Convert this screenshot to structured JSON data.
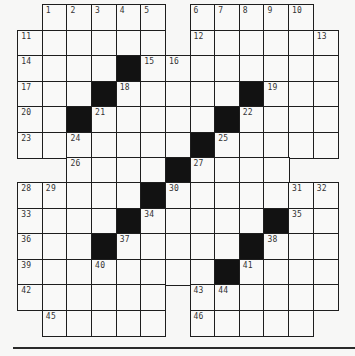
{
  "puzzle": {
    "type": "crossword",
    "rows": 13,
    "cols": 13,
    "layout": {
      "left": 18,
      "top": 5,
      "cell_width": 24.62,
      "cell_height": 25.46
    },
    "legend": {
      ".": "no cell",
      "#": "black square",
      "0": "white unnumbered",
      "n": "white numbered"
    },
    "colors": {
      "background": "#f7f7f6",
      "cell": "#f9f9f8",
      "black": "#121212",
      "line": "#1e1e1e"
    },
    "grid": [
      [
        ".",
        1,
        2,
        3,
        4,
        5,
        ".",
        6,
        7,
        8,
        9,
        10,
        "."
      ],
      [
        11,
        0,
        0,
        0,
        0,
        0,
        ".",
        12,
        0,
        0,
        0,
        0,
        13
      ],
      [
        14,
        0,
        0,
        0,
        "#",
        15,
        16,
        0,
        0,
        0,
        0,
        0,
        0
      ],
      [
        17,
        0,
        0,
        "#",
        18,
        0,
        0,
        0,
        0,
        "#",
        19,
        0,
        0
      ],
      [
        20,
        0,
        "#",
        21,
        0,
        0,
        0,
        0,
        "#",
        22,
        0,
        0,
        0
      ],
      [
        23,
        0,
        24,
        0,
        0,
        0,
        0,
        "#",
        25,
        0,
        0,
        0,
        0
      ],
      [
        ".",
        ".",
        26,
        0,
        0,
        0,
        "#",
        27,
        0,
        0,
        0,
        ".",
        "."
      ],
      [
        28,
        29,
        0,
        0,
        0,
        "#",
        30,
        0,
        0,
        0,
        0,
        31,
        32
      ],
      [
        33,
        0,
        0,
        0,
        "#",
        34,
        0,
        0,
        0,
        0,
        "#",
        35,
        0
      ],
      [
        36,
        0,
        0,
        "#",
        37,
        0,
        0,
        0,
        0,
        "#",
        38,
        0,
        0
      ],
      [
        39,
        0,
        0,
        40,
        0,
        0,
        0,
        0,
        "#",
        41,
        0,
        0,
        0
      ],
      [
        42,
        0,
        0,
        0,
        0,
        0,
        ".",
        43,
        44,
        0,
        0,
        0,
        0
      ],
      [
        ".",
        45,
        0,
        0,
        0,
        0,
        ".",
        46,
        0,
        0,
        0,
        0,
        "."
      ]
    ]
  },
  "footer": {
    "rule": "horizontal-rule"
  }
}
